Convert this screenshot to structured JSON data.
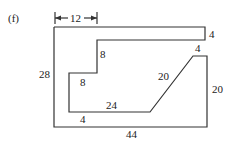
{
  "figure": {
    "label": "(f)",
    "shape": "composite rectilinear outline with diagonal edge",
    "dimensions": {
      "top_width_arrow": "12",
      "top_strip_height": "4",
      "notch_top_width": "4",
      "step_height_upper": "8",
      "step_height_lower": "8",
      "inner_bottom": "24",
      "diagonal": "20",
      "right_height": "20",
      "left_height": "28",
      "bottom_strip_height": "4",
      "bottom_width": "44"
    }
  },
  "colors": {
    "line": "#333333",
    "text": "#222222",
    "background": "#ffffff"
  }
}
